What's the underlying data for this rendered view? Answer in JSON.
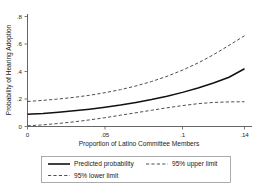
{
  "chart_data": {
    "type": "line",
    "title": "",
    "xlabel": "Proportion of Latino Committee Members",
    "ylabel": "Probability of Hearing Adoption",
    "xlim": [
      0,
      0.145
    ],
    "ylim": [
      0,
      0.85
    ],
    "grid": false,
    "legend_position": "bottom",
    "xticks": [
      0,
      0.05,
      0.1,
      0.14
    ],
    "xtick_labels": [
      "0",
      ".05",
      ".1",
      ".14"
    ],
    "yticks": [
      0,
      0.2,
      0.4,
      0.6,
      0.8
    ],
    "ytick_labels": [
      "0",
      ".2",
      ".4",
      ".6",
      ".8"
    ],
    "x": [
      0,
      0.01,
      0.02,
      0.03,
      0.04,
      0.05,
      0.06,
      0.07,
      0.08,
      0.09,
      0.1,
      0.11,
      0.12,
      0.13,
      0.14
    ],
    "series": [
      {
        "name": "Predicted probability",
        "style": "solid",
        "values": [
          0.09,
          0.095,
          0.104,
          0.114,
          0.126,
          0.14,
          0.156,
          0.175,
          0.196,
          0.22,
          0.248,
          0.28,
          0.316,
          0.358,
          0.42
        ]
      },
      {
        "name": "95% upper limit",
        "style": "dashed",
        "values": [
          0.182,
          0.19,
          0.2,
          0.212,
          0.227,
          0.246,
          0.268,
          0.295,
          0.327,
          0.365,
          0.41,
          0.462,
          0.522,
          0.59,
          0.66
        ]
      },
      {
        "name": "95% lower limit",
        "style": "dashed",
        "values": [
          0.005,
          0.012,
          0.022,
          0.034,
          0.048,
          0.064,
          0.082,
          0.1,
          0.118,
          0.136,
          0.152,
          0.166,
          0.175,
          0.179,
          0.18
        ]
      }
    ]
  },
  "legend": {
    "entries": [
      {
        "label": "Predicted probability",
        "style": "solid"
      },
      {
        "label": "95% upper limit",
        "style": "dashed"
      },
      {
        "label": "95% lower limit",
        "style": "dashed"
      }
    ]
  },
  "axes": {
    "y_title": "Probability of Hearing Adoption",
    "x_title": "Proportion of Latino Committee Members",
    "y_labels": {
      "t0": ".8",
      "t1": ".6",
      "t2": ".4",
      "t3": ".2",
      "t4": "0"
    },
    "x_labels": {
      "t0": "0",
      "t1": ".05",
      "t2": ".1",
      "t3": ".14"
    }
  }
}
